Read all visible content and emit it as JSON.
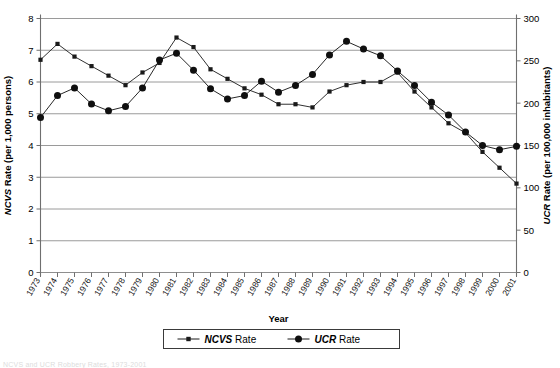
{
  "chart_data": {
    "type": "line",
    "title": "",
    "xlabel": "Year",
    "ylabel": "NCVS Rate (per 1,000 persons)",
    "y2label": "UCR Rate (per 100,000 inhabitants)",
    "grid": true,
    "legend_position": "bottom",
    "ylim": [
      0,
      8
    ],
    "y2lim": [
      0,
      300
    ],
    "yticks": [
      0,
      1,
      2,
      3,
      4,
      5,
      6,
      7,
      8
    ],
    "y2ticks": [
      0,
      50,
      100,
      150,
      200,
      250,
      300
    ],
    "categories": [
      "1973",
      "1974",
      "1975",
      "1976",
      "1977",
      "1978",
      "1979",
      "1980",
      "1981",
      "1982",
      "1983",
      "1984",
      "1985",
      "1986",
      "1987",
      "1988",
      "1989",
      "1990",
      "1991",
      "1992",
      "1993",
      "1994",
      "1995",
      "1996",
      "1997",
      "1998",
      "1999",
      "2000",
      "2001"
    ],
    "series": [
      {
        "name": "NCVS Rate",
        "axis": "left",
        "marker": "square",
        "color": "#1a1a1a",
        "values": [
          6.7,
          7.2,
          6.8,
          6.5,
          6.2,
          5.9,
          6.3,
          6.6,
          7.4,
          7.1,
          6.4,
          6.1,
          5.8,
          5.6,
          5.3,
          5.3,
          5.2,
          5.7,
          5.9,
          6.0,
          6.0,
          6.3,
          5.7,
          5.2,
          4.7,
          4.4,
          3.8,
          3.3,
          2.8
        ]
      },
      {
        "name": "UCR Rate",
        "axis": "right",
        "marker": "circle",
        "color": "#0f0f0f",
        "values": [
          183,
          209,
          218,
          199,
          191,
          196,
          218,
          251,
          259,
          239,
          217,
          205,
          209,
          226,
          213,
          221,
          234,
          257,
          273,
          264,
          256,
          238,
          221,
          201,
          186,
          166,
          150,
          145,
          149
        ]
      }
    ]
  },
  "legend": {
    "items": [
      {
        "label_italic": "NCVS",
        "label_rest": " Rate",
        "marker": "square"
      },
      {
        "label_italic": "UCR",
        "label_rest": " Rate",
        "marker": "circle"
      }
    ]
  },
  "axes": {
    "left_title_italic": "NCVS",
    "left_title_rest": " Rate (per 1,000 persons)",
    "right_title_italic": "UCR",
    "right_title_rest": " Rate (per 100,000 inhabitants)",
    "x_title": "Year"
  },
  "caption": {
    "text": "NCVS and UCR Robbery Rates, 1973-2001"
  }
}
